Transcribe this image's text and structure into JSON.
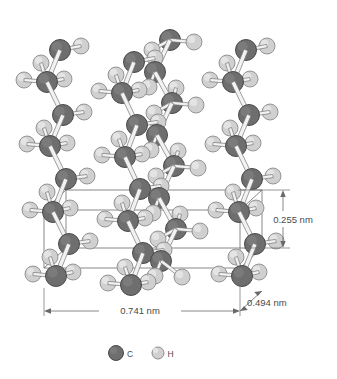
{
  "figure": {
    "name": "polyethylene-unit-cell",
    "background": "#ffffff"
  },
  "dimensions": {
    "width_label": "0.741 nm",
    "depth_label": "0.494 nm",
    "height_label": "0.255 nm"
  },
  "legend": {
    "items": [
      {
        "label": "C",
        "color": "#6e6e6e",
        "stroke": "#4a4a4a",
        "radius": 7.5
      },
      {
        "label": "H",
        "color": "#d0d0d0",
        "stroke": "#8c8c8c",
        "radius": 6.0
      }
    ]
  },
  "colors": {
    "carbon_fill": "#6e6e6e",
    "carbon_stroke": "#4a4a4a",
    "hydrogen_fill": "#d0d0d0",
    "hydrogen_stroke": "#8c8c8c",
    "bond_fill": "#f2f2f2",
    "bond_stroke": "#777777",
    "cell_line": "#6a6a6a",
    "dimension_line": "#6a6a6a",
    "text": "#4a4a4a"
  },
  "unit_cell": {
    "front": {
      "x1": 44,
      "y1": 210,
      "x2": 240,
      "y2": 268
    },
    "depth_offset": {
      "dx": 22,
      "dy": -20
    }
  },
  "atoms": {
    "carbon_radius": 10.5,
    "hydrogen_radius": 8.0,
    "chains": [
      {
        "name": "chain-left",
        "carbons": [
          {
            "x": 60,
            "y": 50
          },
          {
            "x": 47,
            "y": 82
          },
          {
            "x": 63,
            "y": 115
          },
          {
            "x": 50,
            "y": 146
          },
          {
            "x": 66,
            "y": 179
          },
          {
            "x": 53,
            "y": 212
          },
          {
            "x": 69,
            "y": 244
          },
          {
            "x": 56,
            "y": 276
          }
        ],
        "hydrogens": [
          {
            "x": 81,
            "y": 46
          },
          {
            "x": 41,
            "y": 63
          },
          {
            "x": 24,
            "y": 80
          },
          {
            "x": 64,
            "y": 79
          },
          {
            "x": 84,
            "y": 112
          },
          {
            "x": 44,
            "y": 128
          },
          {
            "x": 27,
            "y": 144
          },
          {
            "x": 67,
            "y": 143
          },
          {
            "x": 87,
            "y": 176
          },
          {
            "x": 47,
            "y": 192
          },
          {
            "x": 30,
            "y": 210
          },
          {
            "x": 70,
            "y": 208
          },
          {
            "x": 90,
            "y": 241
          },
          {
            "x": 50,
            "y": 257
          },
          {
            "x": 33,
            "y": 274
          },
          {
            "x": 73,
            "y": 272
          }
        ]
      },
      {
        "name": "chain-middle-back",
        "carbons": [
          {
            "x": 134,
            "y": 62
          },
          {
            "x": 122,
            "y": 93
          },
          {
            "x": 137,
            "y": 125
          },
          {
            "x": 125,
            "y": 157
          },
          {
            "x": 140,
            "y": 189
          },
          {
            "x": 128,
            "y": 221
          },
          {
            "x": 143,
            "y": 253
          },
          {
            "x": 131,
            "y": 285
          }
        ],
        "hydrogens": [
          {
            "x": 155,
            "y": 58
          },
          {
            "x": 116,
            "y": 75
          },
          {
            "x": 99,
            "y": 91
          },
          {
            "x": 139,
            "y": 90
          },
          {
            "x": 158,
            "y": 122
          },
          {
            "x": 119,
            "y": 139
          },
          {
            "x": 102,
            "y": 155
          },
          {
            "x": 142,
            "y": 154
          },
          {
            "x": 161,
            "y": 186
          },
          {
            "x": 122,
            "y": 203
          },
          {
            "x": 105,
            "y": 219
          },
          {
            "x": 145,
            "y": 218
          },
          {
            "x": 164,
            "y": 250
          },
          {
            "x": 125,
            "y": 267
          },
          {
            "x": 108,
            "y": 283
          },
          {
            "x": 148,
            "y": 282
          }
        ]
      },
      {
        "name": "chain-middle-front",
        "carbons": [
          {
            "x": 170,
            "y": 40
          },
          {
            "x": 155,
            "y": 72
          },
          {
            "x": 172,
            "y": 103
          },
          {
            "x": 157,
            "y": 135
          },
          {
            "x": 174,
            "y": 166
          },
          {
            "x": 159,
            "y": 198
          },
          {
            "x": 176,
            "y": 229
          },
          {
            "x": 161,
            "y": 261
          }
        ],
        "hydrogens": [
          {
            "x": 194,
            "y": 42
          },
          {
            "x": 152,
            "y": 50
          },
          {
            "x": 149,
            "y": 87
          },
          {
            "x": 176,
            "y": 88
          },
          {
            "x": 196,
            "y": 105
          },
          {
            "x": 154,
            "y": 113
          },
          {
            "x": 151,
            "y": 150
          },
          {
            "x": 178,
            "y": 151
          },
          {
            "x": 198,
            "y": 168
          },
          {
            "x": 156,
            "y": 176
          },
          {
            "x": 153,
            "y": 213
          },
          {
            "x": 180,
            "y": 214
          },
          {
            "x": 200,
            "y": 231
          },
          {
            "x": 158,
            "y": 239
          },
          {
            "x": 155,
            "y": 276
          },
          {
            "x": 182,
            "y": 277
          }
        ]
      },
      {
        "name": "chain-right",
        "carbons": [
          {
            "x": 246,
            "y": 50
          },
          {
            "x": 233,
            "y": 82
          },
          {
            "x": 249,
            "y": 115
          },
          {
            "x": 236,
            "y": 146
          },
          {
            "x": 252,
            "y": 179
          },
          {
            "x": 239,
            "y": 212
          },
          {
            "x": 255,
            "y": 244
          },
          {
            "x": 242,
            "y": 276
          }
        ],
        "hydrogens": [
          {
            "x": 267,
            "y": 46
          },
          {
            "x": 227,
            "y": 63
          },
          {
            "x": 210,
            "y": 80
          },
          {
            "x": 250,
            "y": 79
          },
          {
            "x": 270,
            "y": 112
          },
          {
            "x": 230,
            "y": 128
          },
          {
            "x": 213,
            "y": 144
          },
          {
            "x": 253,
            "y": 143
          },
          {
            "x": 273,
            "y": 176
          },
          {
            "x": 233,
            "y": 192
          },
          {
            "x": 216,
            "y": 210
          },
          {
            "x": 256,
            "y": 208
          },
          {
            "x": 276,
            "y": 241
          },
          {
            "x": 236,
            "y": 257
          },
          {
            "x": 219,
            "y": 274
          },
          {
            "x": 259,
            "y": 272
          }
        ]
      }
    ]
  }
}
